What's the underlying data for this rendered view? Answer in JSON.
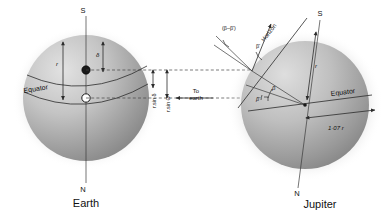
{
  "figure": {
    "background_color": "#ffffff",
    "line_color": "#2b2b2b",
    "dash_color": "#444444"
  },
  "earth": {
    "body_label": "Earth",
    "pole_top_label": "S",
    "pole_bottom_label": "N",
    "equator_label": "Equator",
    "radius_label": "r",
    "declination_label": "δ",
    "center_marker_name": "open-circle-center",
    "point_marker_name": "filled-dot-subobserver",
    "sphere_fill_light": "#d8d8d8",
    "sphere_fill_dark": "#8e8e8e"
  },
  "jupiter": {
    "body_label": "Jupiter",
    "pole_top_label": "S",
    "pole_bottom_label": "N",
    "equator_label": "Equator",
    "radius_label": "r",
    "equatorial_radius_label": "1·07 r",
    "horizon_label": "Horizon",
    "angle_beta_label": "β",
    "angle_beta_prime_label": "β'",
    "angle_beta_prime_upper_label": "β'",
    "angle_difference_label": "(β–β')",
    "sphere_fill_light": "#d6d6d6",
    "sphere_fill_dark": "#8a8a8a"
  },
  "annotations": {
    "to_earth_line1": "To",
    "to_earth_line2": "earth",
    "r_sin_delta": "r.sin δ",
    "r_sin_theta": "r.sin Θ"
  }
}
